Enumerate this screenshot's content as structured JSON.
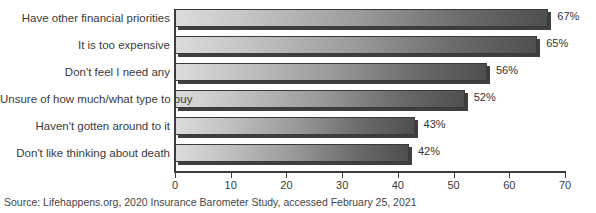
{
  "chart_data": {
    "type": "bar",
    "orientation": "horizontal",
    "title": "",
    "subtitle": "",
    "xlabel": "",
    "ylabel": "",
    "xlim": [
      0,
      70
    ],
    "grid": true,
    "legend": null,
    "categories": [
      "Have other financial priorities",
      "It is too expensive",
      "Don't feel I need any",
      "Unsure of how much/what type to buy",
      "Haven't gotten around to it",
      "Don't like thinking about death"
    ],
    "values": [
      67,
      65,
      56,
      52,
      43,
      42
    ],
    "value_labels": [
      "67%",
      "65%",
      "56%",
      "52%",
      "43%",
      "42%"
    ],
    "xticks": [
      0,
      10,
      20,
      30,
      40,
      50,
      60,
      70
    ],
    "xtick_labels": [
      "0",
      "10",
      "20",
      "30",
      "40",
      "50",
      "60",
      "70"
    ],
    "bar_fill_light": "#dcdcdc",
    "bar_fill_dark": "#4f4f4f",
    "bar_border": "#3a3a3a",
    "axis_color": "#3c3c3c"
  },
  "source": {
    "text": "Source: Lifehappens.org, 2020 Insurance Barometer Study, accessed February 25, 2021"
  }
}
